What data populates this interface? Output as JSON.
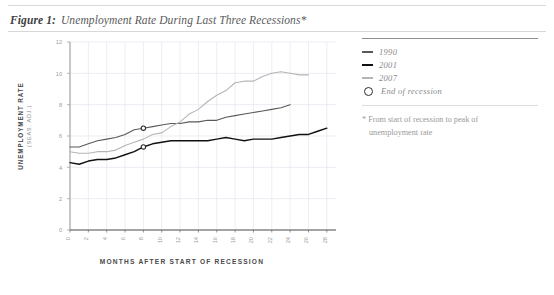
{
  "title": {
    "label": "Figure 1:",
    "text": "Unemployment Rate During Last Three Recessions*"
  },
  "colors": {
    "series_1990": "#595959",
    "series_2001": "#111111",
    "series_2007": "#b5b5b5",
    "marker": "#2e2e2e",
    "grid": "#e2e6ef",
    "axis": "#9a9a9a"
  },
  "legend": {
    "position": "right",
    "entries": [
      {
        "label": "1990",
        "icon": "line-swatch",
        "color": "#595959"
      },
      {
        "label": "2001",
        "icon": "line-swatch",
        "color": "#111111"
      },
      {
        "label": "2007",
        "icon": "line-swatch",
        "color": "#b5b5b5"
      },
      {
        "label": "End of recession",
        "icon": "circle-marker-icon",
        "color": "#2e2e2e"
      }
    ]
  },
  "footnote": {
    "line1": "* From start of recession to peak of",
    "line2": "unemployment rate"
  },
  "chart_data": {
    "type": "line",
    "title": "Unemployment Rate During Last Three Recessions",
    "xlabel": "MONTHS AFTER START OF RECESSION",
    "ylabel": "UNEMPLOYMENT RATE",
    "ylabel_sub": "(SEAS. ADJ.)",
    "xlim": [
      0,
      29
    ],
    "ylim": [
      0,
      12
    ],
    "xticks": [
      0,
      2,
      4,
      6,
      8,
      10,
      12,
      14,
      16,
      18,
      20,
      22,
      24,
      26,
      28
    ],
    "yticks": [
      0,
      2,
      4,
      6,
      8,
      10,
      12
    ],
    "xtick_rotation": 90,
    "grid": true,
    "grid_x": true,
    "grid_y": true,
    "series": [
      {
        "name": "1990",
        "color": "#595959",
        "x": [
          0,
          1,
          2,
          3,
          4,
          5,
          6,
          7,
          8,
          9,
          10,
          11,
          12,
          13,
          14,
          15,
          16,
          17,
          18,
          19,
          20,
          21,
          22,
          23,
          24
        ],
        "values": [
          5.3,
          5.3,
          5.5,
          5.7,
          5.8,
          5.9,
          6.1,
          6.4,
          6.5,
          6.6,
          6.7,
          6.8,
          6.8,
          6.9,
          6.9,
          7.0,
          7.0,
          7.2,
          7.3,
          7.4,
          7.5,
          7.6,
          7.7,
          7.8,
          8.0
        ]
      },
      {
        "name": "2001",
        "color": "#111111",
        "x": [
          0,
          1,
          2,
          3,
          4,
          5,
          6,
          7,
          8,
          9,
          10,
          11,
          12,
          13,
          14,
          15,
          16,
          17,
          18,
          19,
          20,
          21,
          22,
          23,
          24,
          25,
          26,
          27,
          28
        ],
        "values": [
          4.3,
          4.2,
          4.4,
          4.5,
          4.5,
          4.6,
          4.8,
          5.0,
          5.3,
          5.5,
          5.6,
          5.7,
          5.7,
          5.7,
          5.7,
          5.7,
          5.8,
          5.9,
          5.8,
          5.7,
          5.8,
          5.8,
          5.8,
          5.9,
          6.0,
          6.1,
          6.1,
          6.3,
          6.5
        ]
      },
      {
        "name": "2007",
        "color": "#b5b5b5",
        "x": [
          0,
          1,
          2,
          3,
          4,
          5,
          6,
          7,
          8,
          9,
          10,
          11,
          12,
          13,
          14,
          15,
          16,
          17,
          18,
          19,
          20,
          21,
          22,
          23,
          24,
          25,
          26
        ],
        "values": [
          5.0,
          4.9,
          4.9,
          5.0,
          5.0,
          5.1,
          5.4,
          5.6,
          5.8,
          6.1,
          6.2,
          6.6,
          6.9,
          7.4,
          7.7,
          8.2,
          8.6,
          8.9,
          9.4,
          9.5,
          9.5,
          9.8,
          10.0,
          10.1,
          10.0,
          9.9,
          9.9
        ]
      }
    ],
    "markers": [
      {
        "series": "1990",
        "label": "End of recession",
        "x": 8,
        "y": 6.5
      },
      {
        "series": "2001",
        "label": "End of recession",
        "x": 8,
        "y": 5.3
      }
    ]
  }
}
